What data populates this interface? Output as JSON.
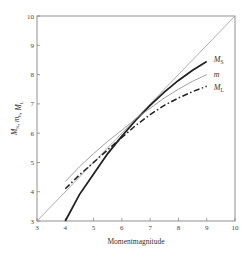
{
  "chart_data": {
    "type": "line",
    "title": "",
    "xlabel": "Momentmagnitude",
    "ylabel": "M_S, m_b, M_L",
    "ylabel_parts": [
      {
        "main": "M",
        "sub": "S"
      },
      {
        "main": ", m",
        "sub": "b"
      },
      {
        "main": ", M",
        "sub": "L"
      }
    ],
    "xlim": [
      3,
      10
    ],
    "ylim": [
      3,
      10
    ],
    "xticks": [
      3,
      4,
      5,
      6,
      7,
      8,
      9,
      10
    ],
    "yticks": [
      3,
      4,
      5,
      6,
      7,
      8,
      9,
      10
    ],
    "grid": false,
    "legend": "right, inline labels at line ends",
    "series": [
      {
        "name": "1:1 reference",
        "style": "thin",
        "color": "#999999",
        "x": [
          3,
          10
        ],
        "y": [
          3,
          10
        ]
      },
      {
        "name": "M_S",
        "label_main": "M",
        "label_sub": "S",
        "style": "thick",
        "color": "#222222",
        "x": [
          4.0,
          4.5,
          5.0,
          5.5,
          6.0,
          6.5,
          7.0,
          7.5,
          8.0,
          8.5,
          9.0
        ],
        "y": [
          3.0,
          3.9,
          4.6,
          5.3,
          5.9,
          6.45,
          6.95,
          7.4,
          7.8,
          8.15,
          8.45
        ]
      },
      {
        "name": "m",
        "label_main": "m",
        "label_sub": "",
        "style": "thin",
        "color": "#888888",
        "x": [
          4.0,
          4.5,
          5.0,
          5.5,
          6.0,
          6.5,
          7.0,
          7.5,
          8.0,
          8.5,
          9.0
        ],
        "y": [
          4.35,
          4.85,
          5.3,
          5.72,
          6.1,
          6.5,
          6.85,
          7.2,
          7.5,
          7.77,
          8.0
        ]
      },
      {
        "name": "M_L",
        "label_main": "M",
        "label_sub": "L",
        "style": "dashdot",
        "color": "#222222",
        "x": [
          4.0,
          4.5,
          5.0,
          5.5,
          6.0,
          6.5,
          7.0,
          7.5,
          8.0,
          8.5,
          9.0
        ],
        "y": [
          4.1,
          4.57,
          5.0,
          5.43,
          5.85,
          6.27,
          6.63,
          6.95,
          7.2,
          7.42,
          7.6
        ]
      }
    ]
  }
}
